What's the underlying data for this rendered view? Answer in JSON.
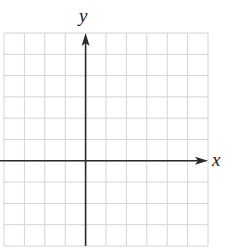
{
  "diagram": {
    "type": "cartesian-coordinate-grid",
    "x_axis_label": "x",
    "y_axis_label": "y",
    "grid": {
      "columns": 10,
      "rows": 10,
      "left": 4,
      "top": 33,
      "right": 208,
      "bottom": 246,
      "y_axis_column_index": 4,
      "x_axis_row_index": 6
    },
    "colors": {
      "grid_line": "#d4d4d4",
      "axis": "#2a2a2a",
      "background": "#ffffff"
    }
  }
}
